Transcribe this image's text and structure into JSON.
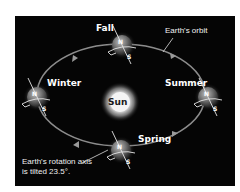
{
  "diagram": {
    "background_color": "#050505",
    "center": {
      "label": "Sun",
      "glow_color": "#ffffff"
    },
    "orbit": {
      "label": "Earth's orbit",
      "color": "#8a8a8a"
    },
    "seasons": [
      {
        "name": "Fall",
        "position": "top"
      },
      {
        "name": "Winter",
        "position": "left"
      },
      {
        "name": "Summer",
        "position": "right"
      },
      {
        "name": "Spring",
        "position": "bottom"
      }
    ],
    "poles": {
      "north": "N",
      "south": "S"
    },
    "caption": {
      "line1": "Earth's rotation axis",
      "line2": "is tilted 23.5°."
    }
  }
}
